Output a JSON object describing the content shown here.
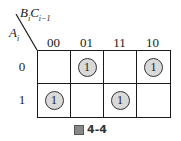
{
  "header": {
    "col_var": "B",
    "col_var_sub": "i",
    "col_var2": "C",
    "col_var2_sub": "i−1",
    "row_var": "A",
    "row_var_sub": "i"
  },
  "columns": [
    "00",
    "01",
    "11",
    "10"
  ],
  "rows": [
    {
      "label": "0",
      "cells": [
        "",
        "1",
        "",
        "1"
      ]
    },
    {
      "label": "1",
      "cells": [
        "1",
        "",
        "1",
        ""
      ]
    }
  ],
  "caption": "4-4",
  "caption_prefix": "圖"
}
